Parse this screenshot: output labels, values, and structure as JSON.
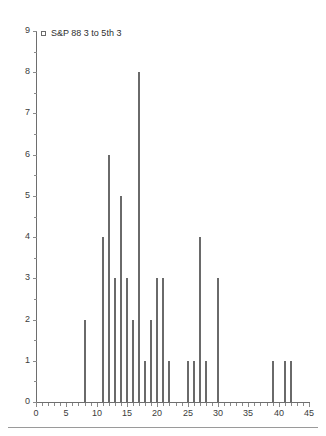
{
  "chart_data": {
    "type": "bar",
    "title": "",
    "subtitle": "",
    "xlabel": "",
    "ylabel": "",
    "xlim": [
      0,
      45
    ],
    "ylim": [
      0,
      9
    ],
    "xticks": [
      0,
      5,
      10,
      15,
      20,
      25,
      30,
      35,
      40,
      45
    ],
    "yticks": [
      0,
      1,
      2,
      3,
      4,
      5,
      6,
      7,
      8,
      9
    ],
    "x_minor_step": 1,
    "y_minor_step": 0.5,
    "grid": false,
    "legend_position": "top-left",
    "legend": [
      {
        "label": "S&P 88 3 to 5th 3",
        "marker": "open-square",
        "color": "#6a6a6a"
      }
    ],
    "series": [
      {
        "name": "S&P 88 3 to 5th 3",
        "color": "#6a6a6a",
        "x": [
          8,
          11,
          12,
          13,
          14,
          15,
          16,
          17,
          18,
          19,
          20,
          21,
          22,
          25,
          26,
          27,
          28,
          30,
          39,
          41,
          42
        ],
        "values": [
          2,
          4,
          6,
          3,
          5,
          3,
          2,
          8,
          1,
          2,
          3,
          3,
          1,
          1,
          1,
          4,
          1,
          3,
          1,
          1,
          1
        ]
      }
    ]
  },
  "axes": {
    "x": {
      "tick_labels": [
        "0",
        "5",
        "10",
        "15",
        "20",
        "25",
        "30",
        "35",
        "40",
        "45"
      ]
    },
    "y": {
      "tick_labels": [
        "0",
        "1",
        "2",
        "3",
        "4",
        "5",
        "6",
        "7",
        "8",
        "9"
      ]
    }
  },
  "colors": {
    "bar": "#6a6a6a",
    "axis": "#6e6e6e",
    "tick": "#8a8a8a",
    "text": "#3c3c3c",
    "rule": "#9a9a9a",
    "background": "#ffffff"
  }
}
